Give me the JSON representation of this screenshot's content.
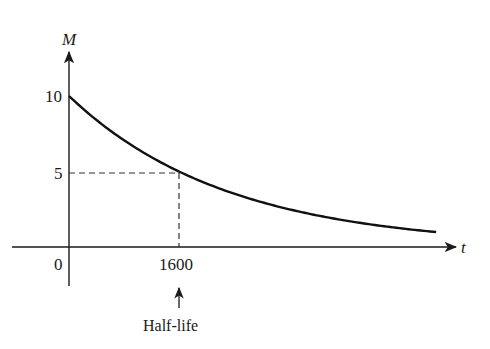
{
  "chart_data": {
    "type": "line",
    "title": "",
    "xlabel": "t",
    "ylabel": "M",
    "series": [
      {
        "name": "M(t) = 10 * (1/2)^(t/1600)",
        "x": [
          0,
          400,
          800,
          1200,
          1600,
          2000,
          2400,
          2800,
          3200,
          3600,
          4000,
          4400,
          4800,
          5200,
          5340
        ],
        "values": [
          10,
          8.41,
          7.07,
          5.95,
          5,
          4.2,
          3.54,
          2.97,
          2.5,
          2.1,
          1.77,
          1.49,
          1.25,
          1.05,
          0.99
        ]
      }
    ],
    "x_ticks": [
      {
        "value": 0,
        "label": "0"
      },
      {
        "value": 1600,
        "label": "1600"
      }
    ],
    "y_ticks": [
      {
        "value": 5,
        "label": "5"
      },
      {
        "value": 10,
        "label": "10"
      }
    ],
    "annotations": [
      {
        "type": "dashed-guide",
        "from": [
          0,
          5
        ],
        "to": [
          1600,
          5
        ]
      },
      {
        "type": "dashed-guide",
        "from": [
          1600,
          5
        ],
        "to": [
          1600,
          0
        ]
      },
      {
        "type": "arrow-label",
        "text": "Half-life",
        "points_to_x": 1600
      }
    ],
    "xlim": [
      0,
      5340
    ],
    "ylim": [
      0,
      10
    ],
    "grid": false,
    "legend": "none"
  },
  "labels": {
    "y_axis": "M",
    "x_axis": "t",
    "y_tick_10": "10",
    "y_tick_5": "5",
    "x_tick_0": "0",
    "x_tick_1600": "1600",
    "half_life": "Half-life"
  },
  "colors": {
    "ink": "#1a1a1a",
    "background": "#ffffff"
  }
}
